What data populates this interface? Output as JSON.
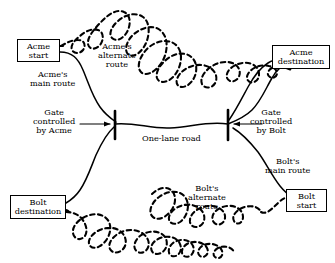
{
  "diagram": {
    "colors": {
      "stroke": "#000000",
      "background": "#ffffff"
    },
    "nodes": [
      {
        "id": "acme-start",
        "label_line1": "Acme",
        "label_line2": "start",
        "x": 17,
        "y": 39,
        "w": 43,
        "h": 23
      },
      {
        "id": "acme-destination",
        "label_line1": "Acme",
        "label_line2": "destination",
        "x": 272,
        "y": 45,
        "w": 58,
        "h": 24
      },
      {
        "id": "bolt-destination",
        "label_line1": "Bolt",
        "label_line2": "destination",
        "x": 10,
        "y": 195,
        "w": 56,
        "h": 24
      },
      {
        "id": "bolt-start",
        "label_line1": "Bolt",
        "label_line2": "start",
        "x": 286,
        "y": 189,
        "w": 41,
        "h": 23
      }
    ],
    "labels": [
      {
        "id": "acme-alternate-route",
        "lines": [
          "Acme's",
          "alternate",
          "route"
        ],
        "x": 98,
        "y": 42
      },
      {
        "id": "acme-main-route",
        "lines": [
          "Acme's",
          "main route"
        ],
        "x": 30,
        "y": 70
      },
      {
        "id": "gate-acme",
        "lines": [
          "Gate",
          "controlled",
          "by Acme"
        ],
        "x": 33,
        "y": 108
      },
      {
        "id": "one-lane-road",
        "lines": [
          "One-lane road"
        ],
        "x": 142,
        "y": 134
      },
      {
        "id": "gate-bolt",
        "lines": [
          "Gate",
          "controlled",
          "by Bolt"
        ],
        "x": 250,
        "y": 108
      },
      {
        "id": "bolt-main-route",
        "lines": [
          "Bolt's",
          "main route"
        ],
        "x": 265,
        "y": 157
      },
      {
        "id": "bolt-alternate-route",
        "lines": [
          "Bolt's",
          "alternate",
          "route"
        ],
        "x": 188,
        "y": 184
      }
    ],
    "gates": [
      {
        "id": "gate-acme-bar",
        "x": 115,
        "y_top": 111,
        "y_bottom": 139
      },
      {
        "id": "gate-bolt-bar",
        "x": 228,
        "y_top": 110,
        "y_bottom": 140
      }
    ],
    "routes": [
      {
        "id": "acme-main-route-path",
        "style": "solid",
        "owner": "Acme",
        "kind": "main"
      },
      {
        "id": "acme-alternate-route-path",
        "style": "dashed",
        "owner": "Acme",
        "kind": "alternate"
      },
      {
        "id": "bolt-main-route-path",
        "style": "solid",
        "owner": "Bolt",
        "kind": "main"
      },
      {
        "id": "bolt-alternate-route-path",
        "style": "dashed",
        "owner": "Bolt",
        "kind": "alternate"
      },
      {
        "id": "one-lane-road-path",
        "style": "solid",
        "owner": "shared",
        "kind": "road"
      }
    ]
  }
}
